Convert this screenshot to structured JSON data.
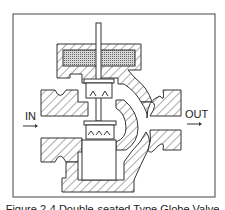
{
  "diagram": {
    "labels": {
      "inlet": "IN",
      "outlet": "OUT"
    },
    "components": [
      "frame",
      "valve-body",
      "bonnet",
      "packing",
      "stem",
      "upper-plug",
      "lower-plug",
      "inlet-port",
      "outlet-port"
    ],
    "colors": {
      "line": "#333333",
      "hatch": "#555555",
      "packing_fill": "#9a9a9a",
      "background": "#ffffff"
    }
  },
  "caption": {
    "text": "Figure 2-4   Double-seated Type Globe Valve"
  }
}
